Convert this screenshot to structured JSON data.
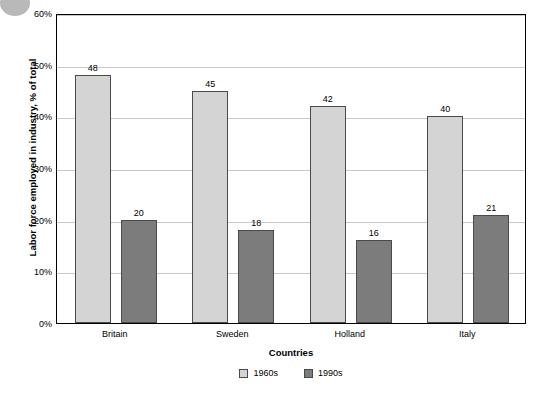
{
  "chart_data": {
    "type": "bar",
    "title": "",
    "xlabel": "Countries",
    "ylabel": "Labor force employed in industry, % of total",
    "categories": [
      "Britain",
      "Sweden",
      "Holland",
      "Italy"
    ],
    "series": [
      {
        "name": "1960s",
        "values": [
          48,
          45,
          42,
          40
        ],
        "color": "#d4d4d4"
      },
      {
        "name": "1990s",
        "values": [
          20,
          18,
          16,
          21
        ],
        "color": "#7c7c7c"
      }
    ],
    "ylim": [
      0,
      60
    ],
    "yticks": [
      "0%",
      "10%",
      "20%",
      "30%",
      "40%",
      "50%",
      "60%"
    ],
    "ytick_values": [
      0,
      10,
      20,
      30,
      40,
      50,
      60
    ],
    "grid": true,
    "legend_position": "bottom",
    "bar_value_labels": [
      {
        "category": "Britain",
        "series": "1960s",
        "label": "48"
      },
      {
        "category": "Britain",
        "series": "1990s",
        "label": "20"
      },
      {
        "category": "Sweden",
        "series": "1960s",
        "label": "45"
      },
      {
        "category": "Sweden",
        "series": "1990s",
        "label": "18"
      },
      {
        "category": "Holland",
        "series": "1960s",
        "label": "42"
      },
      {
        "category": "Holland",
        "series": "1990s",
        "label": "16"
      },
      {
        "category": "Italy",
        "series": "1960s",
        "label": "40"
      },
      {
        "category": "Italy",
        "series": "1990s",
        "label": "21"
      }
    ]
  }
}
